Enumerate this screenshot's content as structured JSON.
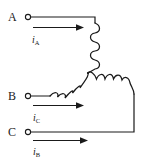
{
  "diagram": {
    "type": "electrical-schematic",
    "connection": "wye",
    "line_color": "#1a1a1a",
    "background_color": "#ffffff",
    "terminals": [
      {
        "id": "A",
        "label": "A",
        "x": 28,
        "y": 17
      },
      {
        "id": "B",
        "label": "B",
        "x": 28,
        "y": 96
      },
      {
        "id": "C",
        "label": "C",
        "x": 28,
        "y": 132
      }
    ],
    "currents": [
      {
        "id": "iA",
        "symbol": "i",
        "subscript": "A",
        "phase": "A",
        "direction": "right"
      },
      {
        "id": "iC",
        "symbol": "i",
        "subscript": "C",
        "phase": "C",
        "direction": "right"
      },
      {
        "id": "iB",
        "symbol": "i",
        "subscript": "B",
        "phase": "B",
        "direction": "right"
      }
    ],
    "coils": [
      {
        "id": "coil-A",
        "orientation": "vertical",
        "turns": 5
      },
      {
        "id": "coil-B",
        "orientation": "diagonal-left",
        "turns": 5
      },
      {
        "id": "coil-C",
        "orientation": "diagonal-right",
        "turns": 5
      }
    ],
    "neutral_point": {
      "x": 88,
      "y": 73
    },
    "arrows": [
      {
        "id": "arrow-iA",
        "from_x": 33,
        "from_y": 27,
        "to_x": 80,
        "to_y": 27
      },
      {
        "id": "arrow-iC",
        "from_x": 33,
        "from_y": 105,
        "to_x": 80,
        "to_y": 105
      },
      {
        "id": "arrow-iB",
        "from_x": 33,
        "from_y": 140,
        "to_x": 86,
        "to_y": 140
      }
    ]
  }
}
